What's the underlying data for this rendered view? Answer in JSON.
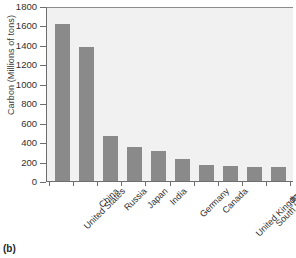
{
  "figure": {
    "panel_tag": "(b)"
  },
  "chart_data": {
    "type": "bar",
    "title": "",
    "subtitle": "",
    "xlabel": "",
    "ylabel": "Carbon (Millions of tons)",
    "categories": [
      "United States",
      "China",
      "Russia",
      "Japan",
      "India",
      "Germany",
      "Canada",
      "United Kingdom",
      "South Korea",
      "Italy"
    ],
    "values": [
      1620,
      1390,
      470,
      355,
      310,
      230,
      165,
      155,
      145,
      140
    ],
    "ylim": [
      0,
      1800
    ],
    "yticks": [
      0,
      200,
      400,
      600,
      800,
      1000,
      1200,
      1400,
      1600,
      1800
    ],
    "ytick_labels": [
      "0",
      "200",
      "400",
      "600",
      "800",
      "1000",
      "1200",
      "1400",
      "1600",
      "1800"
    ],
    "grid": false,
    "legend": null,
    "bar_color": "#8a8a8a",
    "plot_background": "#f1f1f1"
  }
}
